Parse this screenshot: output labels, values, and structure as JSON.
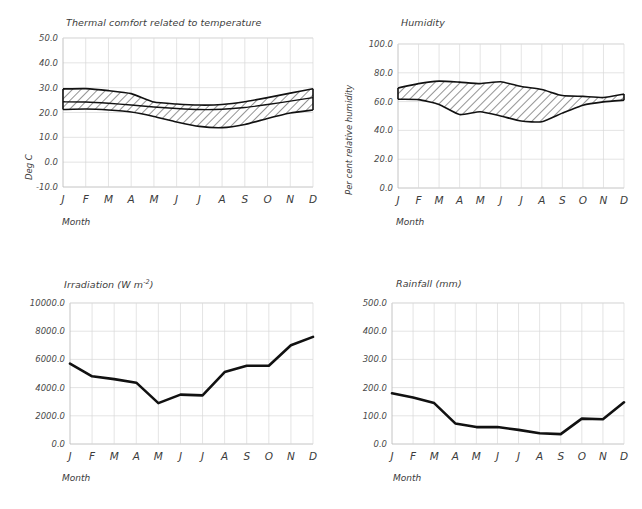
{
  "figure": {
    "panels": [
      "thermal-comfort",
      "humidity",
      "irradiation",
      "rainfall"
    ],
    "x_axis_label": "Month",
    "month_ticks": [
      "J",
      "F",
      "M",
      "A",
      "M",
      "J",
      "J",
      "A",
      "S",
      "O",
      "N",
      "D"
    ]
  },
  "chart_data": [
    {
      "id": "thermal-comfort",
      "type": "area",
      "title": "Thermal comfort related to temperature",
      "xlabel": "Month",
      "ylabel": "Deg C",
      "ylim": [
        -10.0,
        50.0
      ],
      "ytick_labels": [
        "50.0",
        "40.0",
        "30.0",
        "20.0",
        "10.0",
        "0.0",
        "-10.0"
      ],
      "ytick_values": [
        50.0,
        40.0,
        30.0,
        20.0,
        10.0,
        0.0,
        -10.0
      ],
      "grid": true,
      "legend": "none",
      "categories": [
        "J",
        "F",
        "M",
        "A",
        "M",
        "J",
        "J",
        "A",
        "S",
        "O",
        "N",
        "D"
      ],
      "series": [
        {
          "name": "Upper comfort limit",
          "values": [
            29.5,
            29.6,
            28.8,
            27.6,
            24.2,
            23.4,
            23.0,
            23.2,
            24.3,
            26.0,
            27.8,
            29.6
          ]
        },
        {
          "name": "Mean temperature",
          "values": [
            24.3,
            24.2,
            23.7,
            23.0,
            22.2,
            21.6,
            21.2,
            21.3,
            22.0,
            23.2,
            24.6,
            26.0
          ]
        },
        {
          "name": "Lower comfort limit",
          "values": [
            21.2,
            21.4,
            21.0,
            20.2,
            18.4,
            16.2,
            14.4,
            13.9,
            15.2,
            17.6,
            19.8,
            21.0
          ]
        }
      ]
    },
    {
      "id": "humidity",
      "type": "area",
      "title": "Humidity",
      "xlabel": "Month",
      "ylabel": "Per cent relative humidity",
      "ylim": [
        0.0,
        100.0
      ],
      "ytick_labels": [
        "100.0",
        "80.0",
        "60.0",
        "40.0",
        "20.0",
        "0.0"
      ],
      "ytick_values": [
        100.0,
        80.0,
        60.0,
        40.0,
        20.0,
        0.0
      ],
      "grid": true,
      "legend": "none",
      "categories": [
        "J",
        "F",
        "M",
        "A",
        "M",
        "J",
        "J",
        "A",
        "S",
        "O",
        "N",
        "D"
      ],
      "series": [
        {
          "name": "Maximum relative humidity",
          "values": [
            69.5,
            72.5,
            74.2,
            73.5,
            72.5,
            73.8,
            70.5,
            68.4,
            64.2,
            63.6,
            62.8,
            65.2
          ]
        },
        {
          "name": "Minimum relative humidity",
          "values": [
            61.6,
            61.4,
            58.0,
            51.0,
            53.0,
            50.0,
            46.5,
            46.0,
            52.0,
            57.5,
            59.8,
            61.0
          ]
        }
      ]
    },
    {
      "id": "irradiation",
      "type": "line",
      "title": "Irradiation (W m⁻²)",
      "title_base": "Irradiation (W m",
      "title_sup": "-2",
      "title_tail": ")",
      "xlabel": "Month",
      "ylabel": "",
      "ylim": [
        0.0,
        10000.0
      ],
      "ytick_labels": [
        "10000.0",
        "8000.0",
        "6000.0",
        "4000.0",
        "2000.0",
        "0.0"
      ],
      "ytick_values": [
        10000.0,
        8000.0,
        6000.0,
        4000.0,
        2000.0,
        0.0
      ],
      "grid": true,
      "legend": "none",
      "categories": [
        "J",
        "F",
        "M",
        "A",
        "M",
        "J",
        "J",
        "A",
        "S",
        "O",
        "N",
        "D"
      ],
      "values": [
        5700,
        4800,
        4600,
        4350,
        2900,
        3500,
        3450,
        5100,
        5550,
        5550,
        7000,
        7600
      ]
    },
    {
      "id": "rainfall",
      "type": "line",
      "title": "Rainfall  (mm)",
      "xlabel": "Month",
      "ylabel": "",
      "ylim": [
        0.0,
        500.0
      ],
      "ytick_labels": [
        "500.0",
        "400.0",
        "300.0",
        "200.0",
        "100.0",
        "0.0"
      ],
      "ytick_values": [
        500.0,
        400.0,
        300.0,
        200.0,
        100.0,
        0.0
      ],
      "grid": true,
      "legend": "none",
      "categories": [
        "J",
        "F",
        "M",
        "A",
        "M",
        "J",
        "J",
        "A",
        "S",
        "O",
        "N",
        "D"
      ],
      "values": [
        180,
        165,
        145,
        73,
        60,
        60,
        50,
        38,
        35,
        90,
        88,
        148
      ]
    }
  ]
}
